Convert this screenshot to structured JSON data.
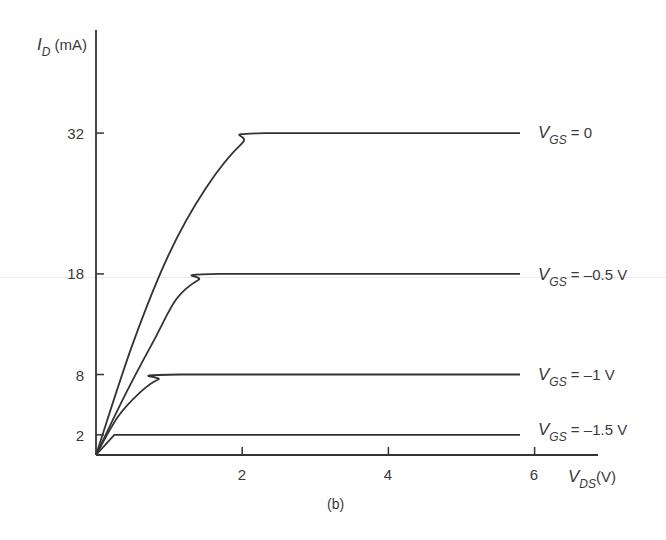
{
  "chart_data": {
    "type": "line",
    "title": "",
    "caption": "(b)",
    "xlabel": {
      "symbol": "V",
      "sub": "DS",
      "unit": "(V)"
    },
    "ylabel": {
      "symbol": "I",
      "sub": "D",
      "unit": "(mA)"
    },
    "xlim": [
      0,
      6.5
    ],
    "ylim": [
      0,
      42
    ],
    "x_ticks": [
      2,
      4,
      6
    ],
    "y_ticks": [
      2,
      8,
      18,
      32
    ],
    "grid": false,
    "legend_position": "inline-right",
    "series": [
      {
        "name": "VGS = 0",
        "label_symbol": "V",
        "label_sub": "GS",
        "label_value": "= 0",
        "saturation_current": 32,
        "pinch_voltage": 2.3,
        "points": [
          [
            0,
            0
          ],
          [
            0.5,
            11
          ],
          [
            1.0,
            20
          ],
          [
            1.5,
            26.5
          ],
          [
            2.0,
            31
          ],
          [
            2.3,
            32
          ],
          [
            5.8,
            32
          ]
        ]
      },
      {
        "name": "VGS = -0.5 V",
        "label_symbol": "V",
        "label_sub": "GS",
        "label_value": "= –0.5 V",
        "saturation_current": 18,
        "pinch_voltage": 1.7,
        "points": [
          [
            0,
            0
          ],
          [
            0.4,
            6
          ],
          [
            0.8,
            11.5
          ],
          [
            1.1,
            15.5
          ],
          [
            1.4,
            17.4
          ],
          [
            1.7,
            18
          ],
          [
            5.8,
            18
          ]
        ]
      },
      {
        "name": "VGS = -1 V",
        "label_symbol": "V",
        "label_sub": "GS",
        "label_value": "= –1 V",
        "saturation_current": 8,
        "pinch_voltage": 1.15,
        "points": [
          [
            0,
            0
          ],
          [
            0.3,
            3.8
          ],
          [
            0.6,
            6.2
          ],
          [
            0.85,
            7.5
          ],
          [
            1.15,
            8
          ],
          [
            5.8,
            8
          ]
        ]
      },
      {
        "name": "VGS = -1.5 V",
        "label_symbol": "V",
        "label_sub": "GS",
        "label_value": "= –1.5 V",
        "saturation_current": 2,
        "pinch_voltage": 0.25,
        "points": [
          [
            0,
            0
          ],
          [
            0.25,
            2
          ],
          [
            5.8,
            2
          ]
        ]
      }
    ]
  },
  "labels": {
    "y_axis_symbol": "I",
    "y_axis_sub": "D",
    "y_axis_unit": "(mA)",
    "x_axis_symbol": "V",
    "x_axis_sub": "DS",
    "x_axis_unit": "(V)",
    "caption": "(b)",
    "y_tick_32": "32",
    "y_tick_18": "18",
    "y_tick_8": "8",
    "y_tick_2": "2",
    "x_tick_2": "2",
    "x_tick_4": "4",
    "x_tick_6": "6",
    "curve_0_sym": "V",
    "curve_0_sub": "GS",
    "curve_0_val": "= 0",
    "curve_1_sym": "V",
    "curve_1_sub": "GS",
    "curve_1_val": "= –0.5 V",
    "curve_2_sym": "V",
    "curve_2_sub": "GS",
    "curve_2_val": "= –1 V",
    "curve_3_sym": "V",
    "curve_3_sub": "GS",
    "curve_3_val": "= –1.5 V"
  },
  "colors": {
    "line": "#333333",
    "text": "#3a3a3a",
    "background": "#ffffff"
  }
}
